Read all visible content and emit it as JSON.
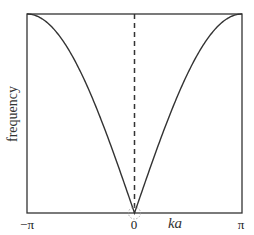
{
  "chart_data": {
    "type": "line",
    "title": "",
    "xlabel": "ka",
    "ylabel": "frequency",
    "xlim": [
      -3.14159,
      3.14159
    ],
    "ylim": [
      0,
      1
    ],
    "x_ticks": [
      {
        "value": -3.14159,
        "label": "−π"
      },
      {
        "value": 0,
        "label": "0"
      },
      {
        "value": 3.14159,
        "label": "π"
      }
    ],
    "grid": false,
    "legend": null,
    "series": [
      {
        "name": "dispersion ω ∝ |sin(ka/2)|",
        "function": "abs(sin(x/2))",
        "x": [
          -3.1416,
          -2.618,
          -2.0944,
          -1.5708,
          -1.0472,
          -0.5236,
          0,
          0.5236,
          1.0472,
          1.5708,
          2.0944,
          2.618,
          3.1416
        ],
        "values": [
          1.0,
          0.966,
          0.866,
          0.707,
          0.5,
          0.259,
          0.0,
          0.259,
          0.5,
          0.707,
          0.866,
          0.966,
          1.0
        ],
        "color": "#333333",
        "style": "solid"
      }
    ],
    "annotations": [
      {
        "type": "vertical-dashed-line",
        "x": 0
      },
      {
        "type": "dotted-circle",
        "x": 0,
        "y": 0
      }
    ]
  },
  "plot_area": {
    "left": 27,
    "top": 14,
    "right": 242,
    "bottom": 213
  },
  "colors": {
    "axis": "#333333",
    "curve": "#333333",
    "dashed": "#333333",
    "circle": "#999999"
  }
}
